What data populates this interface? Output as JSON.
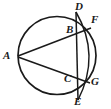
{
  "figure": {
    "kind": "circle-geometry-diagram",
    "width": 111,
    "height": 109,
    "background_color": "#ffffff",
    "stroke_color": "#1a1a1a",
    "label_color": "#1a1a1a"
  },
  "circle": {
    "name": "main-circle",
    "center_x": 57,
    "center_y": 55.5,
    "radius": 39,
    "stroke_width": 1.6
  },
  "secondary_arc": {
    "name": "arc-F-G",
    "description": "small arc on the right passing through F and G",
    "start_x": 76,
    "start_y": 12,
    "end_x": 78,
    "end_y": 100,
    "bulge_x": 99,
    "bulge_y": 56
  },
  "segments": [
    {
      "name": "chord-DE",
      "from": "D",
      "to": "E",
      "x1": 76,
      "y1": 12,
      "x2": 78,
      "y2": 100
    },
    {
      "name": "chord-AF",
      "from": "A",
      "to": "F",
      "x1": 18,
      "y1": 56,
      "x2": 91,
      "y2": 28
    },
    {
      "name": "chord-AG",
      "from": "A",
      "to": "G",
      "x1": 18,
      "y1": 57,
      "x2": 90,
      "y2": 83
    }
  ],
  "points": [
    {
      "id": "A",
      "label": "A",
      "x": 18,
      "y": 56,
      "label_x": 3,
      "label_y": 50,
      "on": "circle-left"
    },
    {
      "id": "B",
      "label": "B",
      "x": 77,
      "y": 33,
      "label_x": 66,
      "label_y": 24,
      "on": "intersection-AF-DE"
    },
    {
      "id": "C",
      "label": "C",
      "x": 78,
      "y": 79,
      "label_x": 64,
      "label_y": 73,
      "on": "intersection-AG-DE"
    },
    {
      "id": "D",
      "label": "D",
      "x": 76,
      "y": 12,
      "label_x": 75,
      "label_y": 1,
      "on": "circle-top-right"
    },
    {
      "id": "E",
      "label": "E",
      "x": 78,
      "y": 100,
      "label_x": 74,
      "label_y": 96,
      "on": "circle-bottom-right"
    },
    {
      "id": "F",
      "label": "F",
      "x": 91,
      "y": 28,
      "label_x": 91,
      "label_y": 14,
      "on": "arc-upper-right"
    },
    {
      "id": "G",
      "label": "G",
      "x": 90,
      "y": 83,
      "label_x": 91,
      "label_y": 76,
      "on": "arc-lower-right"
    }
  ]
}
